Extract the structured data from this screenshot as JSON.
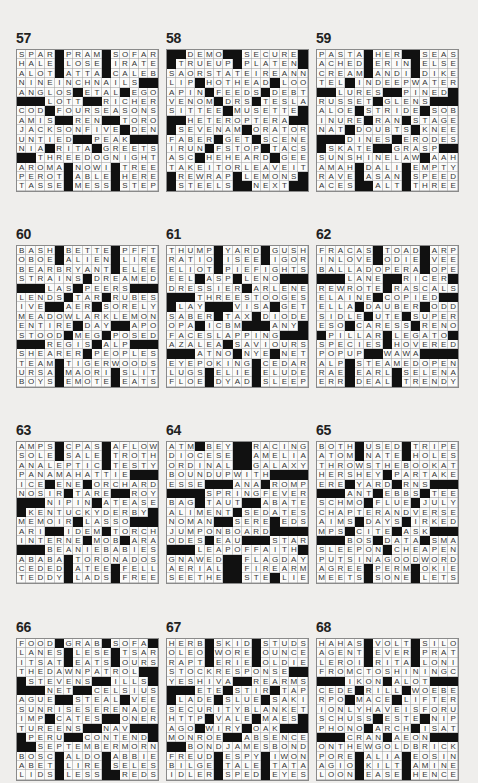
{
  "page": {
    "puzzles": [
      {
        "number": "57",
        "rows": [
          "SPAR#PRAM#SOFAR",
          "HALE#LOSE#IRATE",
          "ALOT#ATTA#CALEB",
          "NINEINCHNAILS##",
          "ANGLOS#ETAL#EGO",
          "###LOTT##RICHER",
          "COD#FOURSEASONS",
          "AMIS##REN##TORO",
          "JACKSONFIVE#DEN",
          "UNTIED##PEAK###",
          "NIA#RITA#GREETS",
          "##THREEDOGNIGHT",
          "AROMA#NOWI#TREE",
          "PEROT#ABLE#HERE",
          "TASSE#MESS#STEP"
        ]
      },
      {
        "number": "58",
        "rows": [
          "##DEMO##SECURE#",
          "#TRUEUP#PLATEN#",
          "SAORSTATEIREANN",
          "LIP#HOTHEAD#LOO",
          "APIN#FEEDS#DEBT",
          "VENOM#DRS#TESLA",
          "SITTEE#MUSETTE#",
          "##HETEROPTERA##",
          "#SEVENAM#ORATOR",
          "FABER#GET#SCENE",
          "IRUN#FSTOP#TACS",
          "ASC#HEHEARD#GEE",
          "TAKEITORLEAVEIT",
          "#REWRAP#LEMONS#",
          "#STEELS##NEXT##"
        ]
      },
      {
        "number": "59",
        "rows": [
          "PASTA#HER##SEAS",
          "ACHED#ERIN#ELSE",
          "CREAM#ANDI#DIKE",
          "TEL#INDEEPWATER",
          "##LURES##PINED#",
          "RUSSET#GLENS###",
          "ALOE#STRIDE#SOB",
          "INURE#RAN#STAGE",
          "NAT#DOUBTS#KNEE",
          "###DINES#ERODES",
          "#SKATE##GRASP##",
          "SUNSHINELAW#AAH",
          "AMAH#DALI#EMPTY",
          "RAVE#ASAN#SPEED",
          "ACES##ALT#THREE"
        ]
      },
      {
        "number": "60",
        "rows": [
          "BASH#BETTE#PFFT",
          "OBOE#ALIEN#LIRE",
          "BEARBRYANT#ELEE",
          "STRAINS#DREAMED",
          "###LAS#PEERS###",
          "LENDS#TAR#RUBES",
          "IVE##AER#SORELY",
          "MEADOWLARKLEMON",
          "ENTIRE#DAY##APO",
          "STOOD#MEG#POSED",
          "###REGIS#ALP###",
          "SHEARER#PEOPLES",
          "TEAM#TIGERWOODS",
          "URSA#MAORI#SLIT",
          "BOYS#EMOTE#EATS"
        ]
      },
      {
        "number": "61",
        "rows": [
          "THUMP#YARD#GUSH",
          "RATIO#ISEE#IGOR",
          "ELIOT#PIEFIGHTS",
          "EEL#ASP#LENO###",
          "DRESSIER#ARLENE",
          "###THREESTOOGES",
          "#LAY###VISA#GET",
          "SABER#TAX#DIODE",
          "OPA#ICBM###ANY#",
          "FACESLAPPING###",
          "AZALEA#SAVIOURS",
          "###ATNO#NYE#NET",
          "EYEPOKING#CEDAR",
          "LUGS#ELIE#ELUDE",
          "FLOE#DYAD#SLEEP"
        ]
      },
      {
        "number": "62",
        "rows": [
          "FRACAS#TOAD#ARP",
          "INLOVE#ODIE#VEE",
          "BALLADOPERA#OPE",
          "###LANE##RICER",
          "REWROTE#RASCALS",
          "ELAINE#COPIED##",
          "ELLA#DAUBER#ODD",
          "SIDLE#UTE#SUPER",
          "ESO#CARESS#RENO",
          "#PILLAR#LEGATO",
          "SPECIES#HOVERED",
          "POPUP##WAWA####",
          "ALP#STEAMEDOPEN",
          "RAE#EARL#SELENA",
          "ERR#DEAL#TRENDY"
        ]
      },
      {
        "number": "63",
        "rows": [
          "AMPS#CPAS#AFLOW",
          "SOLE#SALE#TROTH",
          "ANALEPTIC#TESTY",
          "PANAMAHATTIE###",
          "ICE#ENE#ORCHARD",
          "NOSIR#TARE##ROY",
          "###NIPIN#ATEASE",
          "#KENTUCKYDERBY#",
          "MEMOIR#LASSO###",
          "ARI##IDEM#TORCH",
          "INTERNE#MOB#ARA",
          "###BEANIEBABIES",
          "ABABA#TORONADOS",
          "CEDED#ATEE#FELL",
          "TEDDY#LADS#FREE"
        ]
      },
      {
        "number": "64",
        "rows": [
          "ATM#BEY##RACING",
          "DIOCESE##AMELIA",
          "ORDINAL##GALAXY",
          "BOUNDUPWITH####",
          "ESSE###ANA#ROMP",
          "####SPRINGFEVER",
          "BAG#TAUT##ABATE",
          "ALIMENT#SEDATES",
          "NOMAN##SERE#EDS",
          "JUMPONBOARD####",
          "ODES#EAU###STAR",
          "###LEAPOFFAITH",
          "GNAWED##FLAGDAY",
          "AERIAL##FIREARM",
          "SEETHE##STE#LIE"
        ]
      },
      {
        "number": "65",
        "rows": [
          "BOTH#USED#TRIPE",
          "ATOM#NATE#HOLES",
          "THROWSTHEBOOKAT",
          "HERSHEY#PARTAKE",
          "ERE#YARD#RNS###",
          "###ANT#EBBS#TEE",
          "SCHMO#FLUE#JULY",
          "CHAPTERANDVERSE",
          "AIMS#DAYS#IRKED",
          "MPS#CITE#ASK###",
          "###BOS#DATA#SMA",
          "SLEEPON#CHEAPEN",
          "PUTSINAGOODWORD",
          "AGREE#PERM#OKIE",
          "MEETS#SONE#LETS"
        ]
      },
      {
        "number": "66",
        "rows": [
          "FOOD#GRAB#SOFA",
          "LANES#LESE#TSAR",
          "ITSAT#EATS#OURS",
          "THEDAWNPATROL##",
          "#STEVENS##ILLS#",
          "###NET##CELSIUS",
          "AGUE##STEAL#VEE",
          "SUNRISESERENADE",
          "IMP#CATES##ONER",
          "TUREENS##NAV###",
          "#PERU##CONTEND#",
          "##SEPTEMBERMORN",
          "BOSC#ALDO#ABBIE",
          "ABET#LIRE#SELES",
          "LIDS#LESS##REDS"
        ]
      },
      {
        "number": "67",
        "rows": [
          "HERB#SKID#STUDS",
          "OLEO#WORE#OUNCE",
          "RAPT#ERIE#OLDIE",
          "STOCKRESPONSE##",
          "YESHIVA##REARMS",
          "###ETE#STIR#TAP",
          "#LADE#SLUE#SAKI",
          "SECURITYBLANKET",
          "HTTP#VALE#MAES#",
          "AGO#WIRY#OAK###",
          "MONROE##ABSENCE",
          "##BONDJAMESBOND",
          "FREUD#ESPY#IWON",
          "BILGE#TALE#TATA",
          "IDLER#SPED#EYES"
        ]
      },
      {
        "number": "68",
        "rows": [
          "HAHAS#VOLT#SILO",
          "AGENT#EVER#PRAT",
          "LEROI#RITA#LONI",
          "FROMCTOSHININGC",
          "###IKON#ALOT###",
          "CEDE#RILL#WOEBE",
          "RPO#MACE#LIFTER",
          "IONLYHAVEISFORU",
          "SCHUSS#ESTE#NIP",
          "PHONO#ARCH#ISAT",
          "###CRAN#AEON###",
          "ONTHEWGOLDBRICK",
          "PORE#ALIA#EOSIN",
          "AGIO#KILT#AMINE",
          "LOON#EASE#HENCE"
        ]
      }
    ]
  }
}
